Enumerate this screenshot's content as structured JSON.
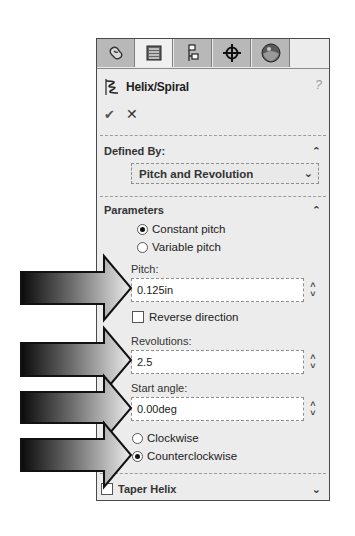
{
  "tabs": [
    {
      "name": "feature-manager",
      "icon": "feature-tree-icon",
      "active": false
    },
    {
      "name": "property-manager",
      "icon": "property-manager-icon",
      "active": true
    },
    {
      "name": "configuration-manager",
      "icon": "configuration-manager-icon",
      "active": false
    },
    {
      "name": "dim-xpert-manager",
      "icon": "crosshair-icon",
      "active": false
    },
    {
      "name": "display-manager",
      "icon": "appearance-sphere-icon",
      "active": false
    }
  ],
  "header": {
    "title": "Helix/Spiral",
    "help_glyph": "?",
    "ok_glyph": "✔",
    "cancel_glyph": "✕"
  },
  "defined_by": {
    "heading": "Defined By:",
    "selected": "Pitch and Revolution",
    "collapse_glyph": "⌃",
    "dropdown_glyph": "⌄"
  },
  "parameters": {
    "heading": "Parameters",
    "collapse_glyph": "⌃",
    "pitch_mode": {
      "options": [
        {
          "label": "Constant pitch",
          "selected": true
        },
        {
          "label": "Variable pitch",
          "selected": false
        }
      ]
    },
    "pitch": {
      "label": "Pitch:",
      "value": "0.125in"
    },
    "reverse_direction": {
      "label": "Reverse direction",
      "checked": false
    },
    "revolutions": {
      "label": "Revolutions:",
      "value": "2.5"
    },
    "start_angle": {
      "label": "Start angle:",
      "value": "0.00deg"
    },
    "direction": {
      "options": [
        {
          "label": "Clockwise",
          "selected": false
        },
        {
          "label": "Counterclockwise",
          "selected": true
        }
      ]
    },
    "spinner_up": "˄",
    "spinner_down": "˅"
  },
  "taper_helix": {
    "label": "Taper Helix",
    "checked": false,
    "expand_glyph": "⌄"
  },
  "callout_arrows": [
    {
      "target": "pitch",
      "tip_y": 288
    },
    {
      "target": "revolutions",
      "tip_y": 360
    },
    {
      "target": "start_angle",
      "tip_y": 408
    },
    {
      "target": "counterclockwise",
      "tip_y": 455
    }
  ],
  "colors": {
    "panel_bg": "#ececec",
    "tab_inactive": "#b8b8b8",
    "tab_active": "#f0f0f0",
    "border": "#4a4a4a"
  }
}
